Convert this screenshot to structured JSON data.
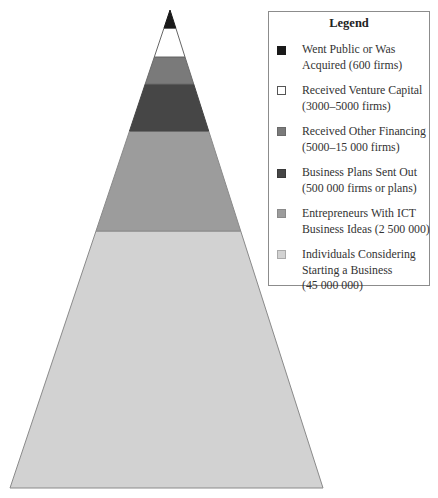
{
  "diagram": {
    "type": "pyramid",
    "layers_top_to_bottom": [
      {
        "id": "went-public",
        "color": "#1a1a1a",
        "y_top": 10,
        "y_bottom": 28
      },
      {
        "id": "venture-capital",
        "color": "#ffffff",
        "y_top": 28,
        "y_bottom": 57
      },
      {
        "id": "other-financing",
        "color": "#7a7a7a",
        "y_top": 57,
        "y_bottom": 84
      },
      {
        "id": "business-plans",
        "color": "#464646",
        "y_top": 84,
        "y_bottom": 131
      },
      {
        "id": "ict-entrepreneurs",
        "color": "#9c9c9c",
        "y_top": 131,
        "y_bottom": 231
      },
      {
        "id": "individuals",
        "color": "#d2d2d2",
        "y_top": 231,
        "y_bottom": 488
      }
    ]
  },
  "legend": {
    "title": "Legend",
    "items": [
      {
        "lines": [
          "Went Public or Was",
          "Acquired (600 firms)"
        ],
        "color": "#1a1a1a",
        "border": "#1a1a1a"
      },
      {
        "lines": [
          "Received Venture Capital",
          "(3000–5000 firms)"
        ],
        "color": "#ffffff",
        "border": "#555555"
      },
      {
        "lines": [
          "Received Other Financing",
          "(5000–15 000 firms)"
        ],
        "color": "#7a7a7a",
        "border": "#6a6a6a"
      },
      {
        "lines": [
          "Business Plans Sent Out",
          "(500 000 firms or plans)"
        ],
        "color": "#464646",
        "border": "#3a3a3a"
      },
      {
        "lines": [
          "Entrepreneurs With ICT",
          "Business Ideas (2 500 000)"
        ],
        "color": "#9c9c9c",
        "border": "#8a8a8a"
      },
      {
        "lines": [
          "Individuals Considering",
          "Starting a Business",
          "(45 000 000)"
        ],
        "color": "#d2d2d2",
        "border": "#aaaaaa"
      }
    ]
  }
}
